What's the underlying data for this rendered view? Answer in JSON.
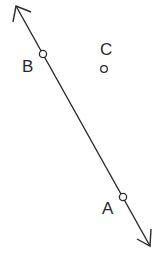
{
  "diagram": {
    "type": "geometry-line-with-points",
    "line": {
      "through": [
        "B",
        "A"
      ],
      "arrows": "both-ends"
    },
    "points": [
      {
        "label": "B",
        "on_line": true
      },
      {
        "label": "C",
        "on_line": false
      },
      {
        "label": "A",
        "on_line": true
      }
    ],
    "colors": {
      "stroke": "#2a2a2a",
      "background": "#ffffff"
    }
  }
}
